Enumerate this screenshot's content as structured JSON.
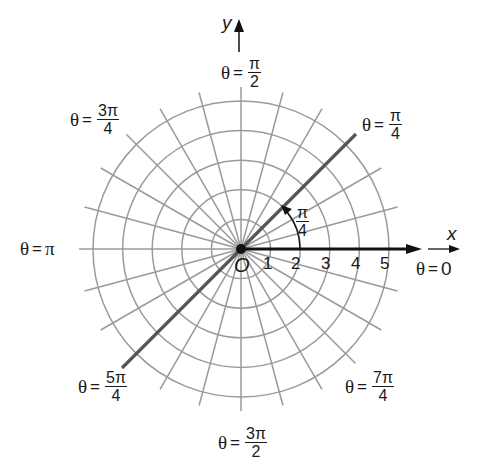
{
  "diagram": {
    "type": "polar-coordinate-grid",
    "center": {
      "x": 241,
      "y": 249
    },
    "unit_px": 29.6,
    "rings": [
      1,
      2,
      3,
      4,
      5
    ],
    "ray_step_deg": 15,
    "colors": {
      "grid": "#9a9a9a",
      "axis": "#111111",
      "ray_line": "#555555",
      "text": "#1a1a1a"
    },
    "axes": {
      "x_label": "x",
      "y_label": "y",
      "origin_label": "O"
    },
    "radial_ticks": [
      "1",
      "2",
      "3",
      "4",
      "5"
    ],
    "angle_arc": {
      "num": "π",
      "den": "4"
    },
    "angle_labels": {
      "theta0": {
        "theta": "θ",
        "eq": "=",
        "value": "0"
      },
      "pi_over_4": {
        "theta": "θ",
        "eq": "=",
        "num": "π",
        "den": "4"
      },
      "pi_over_2": {
        "theta": "θ",
        "eq": "=",
        "num": "π",
        "den": "2"
      },
      "three_pi_over_4": {
        "theta": "θ",
        "eq": "=",
        "num": "3π",
        "den": "4"
      },
      "pi": {
        "theta": "θ",
        "eq": "=",
        "value": "π"
      },
      "five_pi_over_4": {
        "theta": "θ",
        "eq": "=",
        "num": "5π",
        "den": "4"
      },
      "three_pi_over_2": {
        "theta": "θ",
        "eq": "=",
        "num": "3π",
        "den": "2"
      },
      "seven_pi_over_4": {
        "theta": "θ",
        "eq": "=",
        "num": "7π",
        "den": "4"
      }
    }
  }
}
